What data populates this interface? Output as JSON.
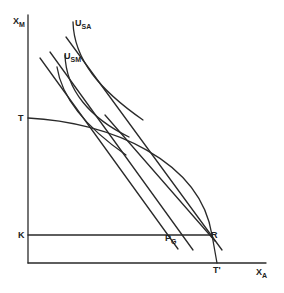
{
  "diagram": {
    "axes": {
      "y_label": "X",
      "y_label_sub": "M",
      "x_label": "X",
      "x_label_sub": "A"
    },
    "points": {
      "T_top": "T",
      "K": "K",
      "T_bottom": "T'",
      "R": "R",
      "P": "P",
      "P_sub": "G"
    },
    "curves": {
      "u_sa": "U",
      "u_sa_sub": "SA",
      "u_sm": "U",
      "u_sm_sub": "SM"
    },
    "colors": {
      "ink": "#2a2a2a",
      "background": "#ffffff"
    }
  }
}
